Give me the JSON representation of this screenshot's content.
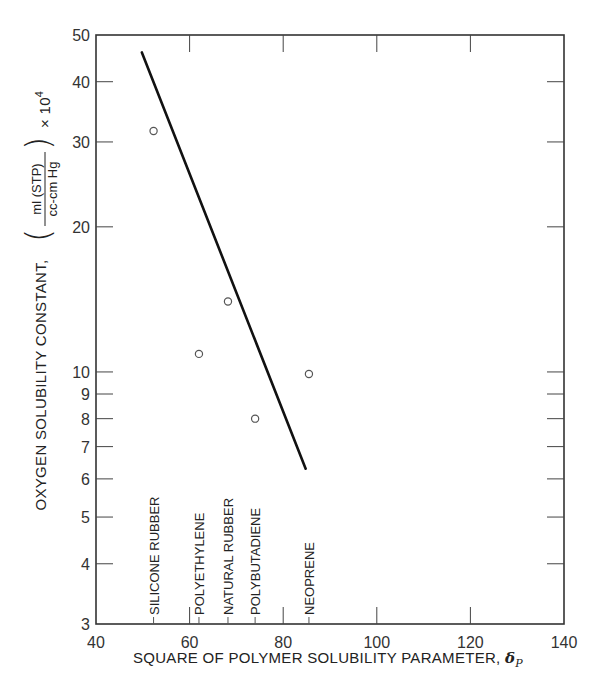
{
  "chart_data": {
    "type": "scatter",
    "title": "",
    "xlabel": "SQUARE OF POLYMER SOLUBILITY PARAMETER, δP",
    "xlabel_main": "SQUARE OF POLYMER SOLUBILITY PARAMETER, ",
    "xlabel_symbol": "δ",
    "xlabel_subscript": "P",
    "ylabel": "OXYGEN SOLUBILITY CONSTANT, (ml (STP) / cc-cm Hg) × 10^4",
    "ylabel_main": "OXYGEN SOLUBILITY CONSTANT,",
    "ylabel_frac_num": "ml (STP)",
    "ylabel_frac_den": "cc-cm Hg",
    "ylabel_mult": "× 10",
    "ylabel_exp": "4",
    "xlim": [
      40,
      140
    ],
    "ylim": [
      3,
      50
    ],
    "yscale": "log",
    "grid": false,
    "x_ticks": [
      40,
      60,
      80,
      100,
      120,
      140
    ],
    "y_ticks": [
      3,
      4,
      5,
      6,
      7,
      8,
      9,
      10,
      20,
      30,
      40,
      50
    ],
    "series": [
      {
        "name": "polymers",
        "marker": "open-circle",
        "points": [
          {
            "label": "SILICONE RUBBER",
            "x": 52.3,
            "y": 31.6
          },
          {
            "label": "POLYETHYLENE",
            "x": 62.0,
            "y": 10.9
          },
          {
            "label": "NATURAL RUBBER",
            "x": 68.2,
            "y": 14.0
          },
          {
            "label": "POLYBUTADIENE",
            "x": 74.0,
            "y": 8.0
          },
          {
            "label": "NEOPRENE",
            "x": 85.5,
            "y": 9.9
          }
        ]
      },
      {
        "name": "fit-line",
        "type": "line",
        "points": [
          {
            "x": 49.8,
            "y": 46.0
          },
          {
            "x": 84.8,
            "y": 6.3
          }
        ]
      }
    ],
    "annotations": [
      {
        "text": "SILICONE RUBBER",
        "x": 52.3
      },
      {
        "text": "POLYETHYLENE",
        "x": 62.0
      },
      {
        "text": "NATURAL RUBBER",
        "x": 68.2
      },
      {
        "text": "POLYBUTADIENE",
        "x": 74.0
      },
      {
        "text": "NEOPRENE",
        "x": 85.5
      }
    ]
  }
}
